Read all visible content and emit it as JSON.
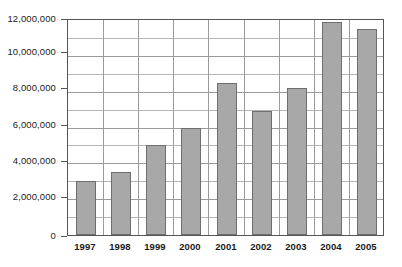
{
  "chart_data": {
    "type": "bar",
    "title": "",
    "xlabel": "",
    "ylabel": "",
    "categories": [
      "1997",
      "1998",
      "1999",
      "2000",
      "2001",
      "2002",
      "2003",
      "2004",
      "2005"
    ],
    "values": [
      3000000,
      3500000,
      5000000,
      6000000,
      8500000,
      6900000,
      8200000,
      11900000,
      11500000
    ],
    "ylim": [
      0,
      12000000
    ],
    "y_major_ticks": [
      0,
      2000000,
      4000000,
      6000000,
      8000000,
      10000000,
      12000000
    ],
    "y_tick_labels": [
      "0",
      "2,000,000",
      "4,000,000",
      "6,000,000",
      "8,000,000",
      "10,000,000",
      "12,000,000"
    ],
    "y_minor_ticks": [
      1000000,
      3000000,
      5000000,
      7000000,
      9000000,
      11000000
    ],
    "grid": true,
    "grid_axis": "both",
    "legend": false,
    "legend_position": "none",
    "bar_color": "#a8a8a8",
    "bar_border_color": "#6e6e6e",
    "gridline_color": "#9a9a9a",
    "axis_color": "#555555",
    "background_color": "#ffffff"
  }
}
